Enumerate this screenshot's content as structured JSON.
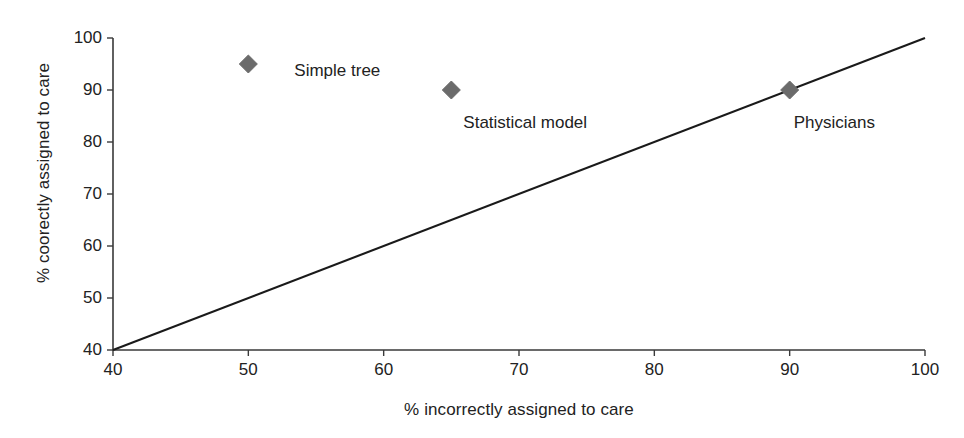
{
  "chart_data": {
    "type": "scatter",
    "title": "",
    "xlabel": "% incorrectly assigned to care",
    "ylabel": "% coorectly assigned to care",
    "xlim": [
      40,
      100
    ],
    "ylim": [
      40,
      100
    ],
    "xticks": [
      "40",
      "50",
      "60",
      "70",
      "80",
      "90",
      "100"
    ],
    "yticks": [
      "40",
      "50",
      "60",
      "70",
      "80",
      "90",
      "100"
    ],
    "xtick_values": [
      40,
      50,
      60,
      70,
      80,
      90,
      100
    ],
    "ytick_values": [
      40,
      50,
      60,
      70,
      80,
      90,
      100
    ],
    "grid": false,
    "legend": "none",
    "marker_shape": "diamond",
    "marker_color": "#6b6b6b",
    "line_color": "#1a1a1a",
    "points": [
      {
        "label": "Simple tree",
        "x": 50,
        "y": 95,
        "label_dx": 46,
        "label_dy": 6
      },
      {
        "label": "Statistical model",
        "x": 65,
        "y": 90,
        "label_dx": 12,
        "label_dy": 32
      },
      {
        "label": "Physicians",
        "x": 90,
        "y": 90,
        "label_dx": 4,
        "label_dy": 32
      }
    ],
    "reference_line": {
      "name": "diagonal",
      "from": [
        40,
        40
      ],
      "to": [
        100,
        100
      ]
    }
  }
}
